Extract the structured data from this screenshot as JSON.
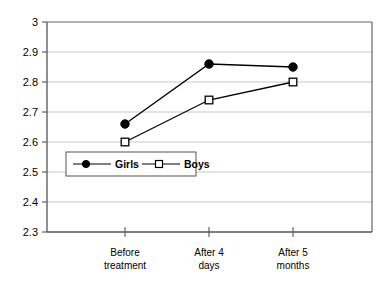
{
  "chart_data": {
    "type": "line",
    "title": "",
    "subtitle": "",
    "xlabel": "",
    "ylabel": "",
    "categories": [
      "Before treatment",
      "After 4 days",
      "After 5 months"
    ],
    "category_lines": [
      [
        "Before",
        "treatment"
      ],
      [
        "After 4",
        "days"
      ],
      [
        "After 5",
        "months"
      ]
    ],
    "series": [
      {
        "name": "Girls",
        "marker": "filled-circle",
        "color": "#000000",
        "values": [
          2.66,
          2.86,
          2.85
        ]
      },
      {
        "name": "Boys",
        "marker": "open-square",
        "color": "#000000",
        "values": [
          2.6,
          2.74,
          2.8
        ]
      }
    ],
    "ylim": [
      2.3,
      3.0
    ],
    "ytick_labels": [
      "3",
      "2.9",
      "2.8",
      "2.7",
      "2.6",
      "2.5",
      "2.4",
      "2.3"
    ],
    "ytick_values": [
      3.0,
      2.9,
      2.8,
      2.7,
      2.6,
      2.5,
      2.4,
      2.3
    ],
    "grid": true,
    "grid_axis": "y",
    "grid_color": "#c8c8c8",
    "axis_color": "#555555",
    "plot_background": "#ffffff",
    "legend": {
      "position": "inside-lower-left",
      "entries": [
        "Girls",
        "Boys"
      ],
      "border": true
    }
  },
  "axis": {
    "y_labels": [
      "3",
      "2.9",
      "2.8",
      "2.7",
      "2.6",
      "2.5",
      "2.4",
      "2.3"
    ]
  },
  "legend": {
    "girls_label": "Girls",
    "boys_label": "Boys"
  },
  "categories": {
    "c0_line1": "Before",
    "c0_line2": "treatment",
    "c1_line1": "After 4",
    "c1_line2": "days",
    "c2_line1": "After 5",
    "c2_line2": "months"
  }
}
